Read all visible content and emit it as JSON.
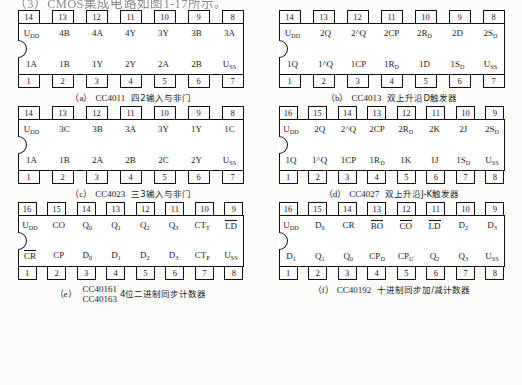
{
  "page": {
    "headline": "（3）CMOS集成电路如图1-17所示。"
  },
  "chips": [
    {
      "key": "cc4011",
      "pin_count": 14,
      "top_pins": [
        "14",
        "13",
        "12",
        "11",
        "10",
        "9",
        "8"
      ],
      "bottom_pins": [
        "1",
        "2",
        "3",
        "4",
        "5",
        "6",
        "7"
      ],
      "top_labels": [
        "U|DD",
        "4B",
        "4A",
        "4Y",
        "3Y",
        "3B",
        "3A"
      ],
      "bottom_labels": [
        "1A",
        "1B",
        "1Y",
        "2Y",
        "2A",
        "2B",
        "U|SS"
      ],
      "caption_tag": "（a）",
      "caption_part": "CC4011",
      "caption_desc": "四2输入与非门"
    },
    {
      "key": "cc4013",
      "pin_count": 14,
      "top_pins": [
        "14",
        "13",
        "12",
        "11",
        "10",
        "9",
        "8"
      ],
      "bottom_pins": [
        "1",
        "2",
        "3",
        "4",
        "5",
        "6",
        "7"
      ],
      "top_labels": [
        "U|DD",
        "2Q",
        "2^Q",
        "2CP",
        "2R|D",
        "2D",
        "2S|D"
      ],
      "bottom_labels": [
        "1Q",
        "1^Q",
        "1CP",
        "1R|D",
        "1D",
        "1S|D",
        "U|SS"
      ],
      "caption_tag": "（b）",
      "caption_part": "CC4013",
      "caption_desc": "双上升沿D触发器"
    },
    {
      "key": "cc4023",
      "pin_count": 14,
      "top_pins": [
        "14",
        "13",
        "12",
        "11",
        "10",
        "9",
        "8"
      ],
      "bottom_pins": [
        "1",
        "2",
        "3",
        "4",
        "5",
        "6",
        "7"
      ],
      "top_labels": [
        "U|DD",
        "3C",
        "3B",
        "3A",
        "3Y",
        "1Y",
        "1C"
      ],
      "bottom_labels": [
        "1A",
        "1B",
        "2A",
        "2B",
        "2C",
        "2Y",
        "U|SS"
      ],
      "caption_tag": "（c）",
      "caption_part": "CC4023",
      "caption_desc": "三3输入与非门"
    },
    {
      "key": "cc4027",
      "pin_count": 16,
      "top_pins": [
        "16",
        "15",
        "14",
        "13",
        "12",
        "11",
        "10",
        "9"
      ],
      "bottom_pins": [
        "1",
        "2",
        "3",
        "4",
        "5",
        "6",
        "7",
        "8"
      ],
      "top_labels": [
        "U|DD",
        "2Q",
        "2^Q",
        "2CP",
        "2R|D",
        "2K",
        "2J",
        "2S|D"
      ],
      "bottom_labels": [
        "1Q",
        "1^Q",
        "1CP",
        "1R|D",
        "1K",
        "1J",
        "1S|D",
        "U|SS"
      ],
      "caption_tag": "（d）",
      "caption_part": "CC4027",
      "caption_desc": "双上升沿J-K触发器"
    },
    {
      "key": "cc40161",
      "pin_count": 16,
      "top_pins": [
        "16",
        "15",
        "14",
        "13",
        "12",
        "11",
        "10",
        "9"
      ],
      "bottom_pins": [
        "1",
        "2",
        "3",
        "4",
        "5",
        "6",
        "7",
        "8"
      ],
      "top_labels": [
        "U|DD",
        "CO",
        "Q|0",
        "Q|1",
        "Q|2",
        "Q|3",
        "CT|T",
        "^LD"
      ],
      "bottom_labels": [
        "^CR",
        "CP",
        "D|0",
        "D|1",
        "D|2",
        "D|3",
        "CT|P",
        "U|SS"
      ],
      "caption_tag": "（e）",
      "caption_part_line1": "CC40161",
      "caption_part_line2": "CC40163",
      "caption_desc": "4位二进制同步计数器"
    },
    {
      "key": "cc40192",
      "pin_count": 16,
      "top_pins": [
        "16",
        "15",
        "14",
        "13",
        "12",
        "11",
        "10",
        "9"
      ],
      "bottom_pins": [
        "1",
        "2",
        "3",
        "4",
        "5",
        "6",
        "7",
        "8"
      ],
      "top_labels": [
        "U|DD",
        "D|0",
        "CR",
        "^BO",
        "^CO",
        "^LD",
        "D|2",
        "D|3"
      ],
      "bottom_labels": [
        "D|1",
        "Q|1",
        "Q|0",
        "CP|D",
        "CP|U",
        "Q|2",
        "Q|3",
        "U|SS"
      ],
      "caption_tag": "（f）",
      "caption_part": "CC40192",
      "caption_desc": "十进制同步加/减计数器"
    }
  ]
}
